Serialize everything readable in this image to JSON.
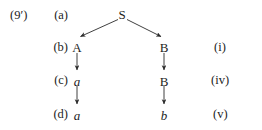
{
  "figure": {
    "example_number": "(9′)",
    "background_color": "#ffffff",
    "ink_color": "#232323"
  },
  "rows": [
    {
      "label": "(a)"
    },
    {
      "label": "(b)"
    },
    {
      "label": "(c)"
    },
    {
      "label": "(d)"
    }
  ],
  "nodes": {
    "root": "S",
    "left_b": "A",
    "left_c": "a",
    "left_d": "a",
    "right_b": "B",
    "right_c": "B",
    "right_d": "b"
  },
  "rule_labels": [
    {
      "text": "(i)"
    },
    {
      "text": "(iv)"
    },
    {
      "text": "(v)"
    }
  ],
  "arrows": [
    {
      "name": "branch-left",
      "from": "S",
      "to": "A"
    },
    {
      "name": "branch-right",
      "from": "S",
      "to": "B"
    },
    {
      "name": "rewrite-left-b-to-c",
      "from": "A",
      "to": "a"
    },
    {
      "name": "rewrite-left-c-to-d",
      "from": "a",
      "to": "a"
    },
    {
      "name": "rewrite-right-b-to-c",
      "from": "B",
      "to": "B"
    },
    {
      "name": "rewrite-right-c-to-d",
      "from": "B",
      "to": "b"
    }
  ]
}
